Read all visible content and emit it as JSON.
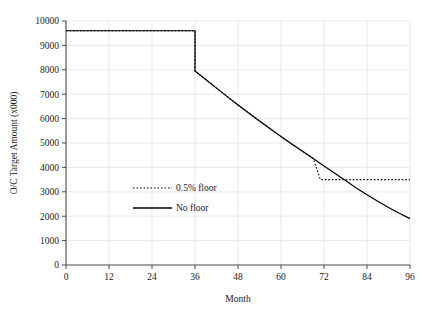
{
  "chart_data": {
    "type": "line",
    "title": "",
    "xlabel": "Month",
    "ylabel": "O/C Target Amount (x000)",
    "xlim": [
      0,
      96
    ],
    "ylim": [
      0,
      10000
    ],
    "xticks": [
      0,
      12,
      24,
      36,
      48,
      60,
      72,
      84,
      96
    ],
    "yticks": [
      0,
      1000,
      2000,
      3000,
      4000,
      5000,
      6000,
      7000,
      8000,
      9000,
      10000
    ],
    "xtick_labels": [
      "0",
      "12",
      "24",
      "36",
      "48",
      "60",
      "72",
      "84",
      "96"
    ],
    "ytick_labels": [
      "0",
      "1000",
      "2000",
      "3000",
      "4000",
      "5000",
      "6000",
      "7000",
      "8000",
      "9000",
      "10000"
    ],
    "grid": true,
    "legend_position": "center-left",
    "series": [
      {
        "name": "0.5% floor",
        "style": "dotted",
        "color": "#000000",
        "x": [
          0,
          6,
          12,
          18,
          24,
          30,
          36,
          36,
          39,
          42,
          45,
          48,
          51,
          54,
          57,
          60,
          63,
          66,
          69,
          71,
          72,
          78,
          84,
          90,
          96
        ],
        "values": [
          9600,
          9600,
          9600,
          9600,
          9600,
          9600,
          9600,
          7950,
          7600,
          7250,
          6900,
          6560,
          6230,
          5900,
          5580,
          5270,
          4960,
          4660,
          4360,
          3500,
          3500,
          3500,
          3500,
          3500,
          3500
        ]
      },
      {
        "name": "No floor",
        "style": "solid",
        "color": "#000000",
        "x": [
          0,
          6,
          12,
          18,
          24,
          30,
          36,
          36,
          39,
          42,
          45,
          48,
          51,
          54,
          57,
          60,
          63,
          66,
          69,
          72,
          75,
          78,
          81,
          84,
          87,
          90,
          93,
          96
        ],
        "values": [
          9600,
          9600,
          9600,
          9600,
          9600,
          9600,
          9600,
          7950,
          7600,
          7250,
          6900,
          6560,
          6230,
          5900,
          5580,
          5270,
          4960,
          4660,
          4360,
          4060,
          3760,
          3460,
          3160,
          2880,
          2610,
          2360,
          2120,
          1900
        ]
      }
    ],
    "legend": [
      {
        "label": "0.5% floor",
        "style": "dotted"
      },
      {
        "label": "No floor",
        "style": "solid"
      }
    ]
  }
}
